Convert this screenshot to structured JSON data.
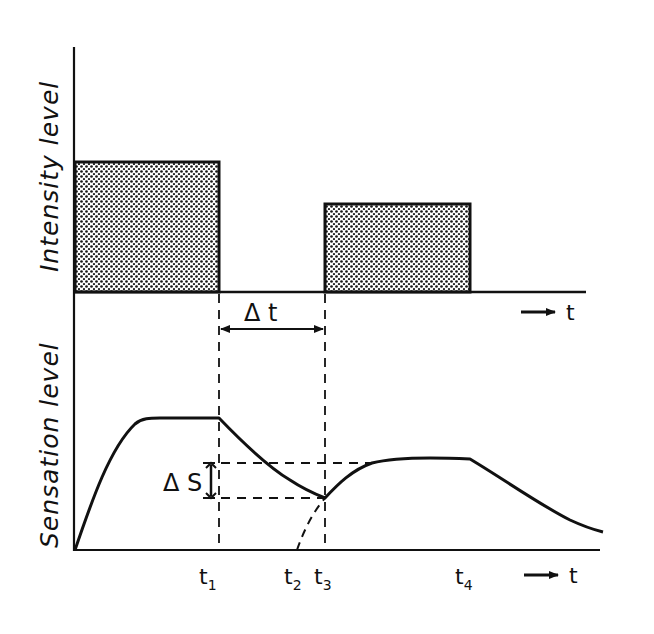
{
  "diagram": {
    "top_panel": {
      "ylabel": "Intensity level",
      "time_arrow_label": "t",
      "stimuli": [
        {
          "name": "stimulus-1",
          "start": "0",
          "end": "t1",
          "relative_level": 0.55
        },
        {
          "name": "stimulus-2",
          "start": "t3",
          "end": "t4",
          "relative_level": 0.37
        }
      ],
      "interval_label": "Δ t"
    },
    "bottom_panel": {
      "ylabel": "Sensation level",
      "time_arrow_label": "t",
      "delta_s_label": "Δ S",
      "ticks": [
        {
          "base": "t",
          "sub": "1"
        },
        {
          "base": "t",
          "sub": "2"
        },
        {
          "base": "t",
          "sub": "3"
        },
        {
          "base": "t",
          "sub": "4"
        }
      ],
      "curve_description": "Sensation rises to plateau during stimulus 1, decays after t1, second stimulus at t3 raises sensation to a lower plateau, decays after t4; dashed curve from t2 shows onset had there been no residual sensation"
    },
    "colors": {
      "ink": "#111111",
      "background": "#ffffff"
    }
  }
}
